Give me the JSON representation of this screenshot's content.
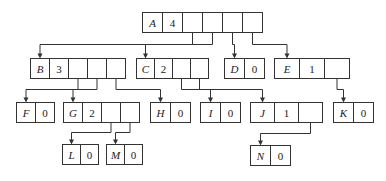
{
  "diagram": {
    "type": "tree-child-list-representation",
    "colors": {
      "stroke": "#333333",
      "text": "#222222",
      "background": "#ffffff"
    },
    "nodes": [
      {
        "id": "A",
        "label": "A",
        "degree": "4",
        "x": 142,
        "y": 12,
        "cellw": 20,
        "cells": 6
      },
      {
        "id": "B",
        "label": "B",
        "degree": "3",
        "x": 30,
        "y": 58,
        "cellw": 19,
        "cells": 5
      },
      {
        "id": "C",
        "label": "C",
        "degree": "2",
        "x": 136,
        "y": 58,
        "cellw": 18,
        "cells": 4
      },
      {
        "id": "D",
        "label": "D",
        "degree": "0",
        "x": 224,
        "y": 58,
        "cellw": 20,
        "cells": 2
      },
      {
        "id": "E",
        "label": "E",
        "degree": "1",
        "x": 274,
        "y": 58,
        "cellw": 25,
        "cells": 3
      },
      {
        "id": "F",
        "label": "F",
        "degree": "0",
        "x": 16,
        "y": 102,
        "cellw": 19,
        "cells": 2
      },
      {
        "id": "G",
        "label": "G",
        "degree": "2",
        "x": 63,
        "y": 102,
        "cellw": 19,
        "cells": 4
      },
      {
        "id": "H",
        "label": "H",
        "degree": "0",
        "x": 150,
        "y": 102,
        "cellw": 20,
        "cells": 2
      },
      {
        "id": "I",
        "label": "I",
        "degree": "0",
        "x": 200,
        "y": 102,
        "cellw": 20,
        "cells": 2
      },
      {
        "id": "J",
        "label": "J",
        "degree": "1",
        "x": 250,
        "y": 102,
        "cellw": 24,
        "cells": 3
      },
      {
        "id": "K",
        "label": "K",
        "degree": "0",
        "x": 333,
        "y": 102,
        "cellw": 20,
        "cells": 2
      },
      {
        "id": "L",
        "label": "L",
        "degree": "0",
        "x": 62,
        "y": 144,
        "cellw": 18,
        "cells": 2
      },
      {
        "id": "M",
        "label": "M",
        "degree": "0",
        "x": 106,
        "y": 144,
        "cellw": 18,
        "cells": 2
      },
      {
        "id": "N",
        "label": "N",
        "degree": "0",
        "x": 250,
        "y": 145,
        "cellw": 20,
        "cells": 2
      }
    ],
    "edges": [
      {
        "from": "A",
        "to": "B"
      },
      {
        "from": "A",
        "to": "C"
      },
      {
        "from": "A",
        "to": "D"
      },
      {
        "from": "A",
        "to": "E"
      },
      {
        "from": "B",
        "to": "F"
      },
      {
        "from": "B",
        "to": "G"
      },
      {
        "from": "B",
        "to": "H"
      },
      {
        "from": "C",
        "to": "I"
      },
      {
        "from": "C",
        "to": "J"
      },
      {
        "from": "E",
        "to": "K"
      },
      {
        "from": "G",
        "to": "L"
      },
      {
        "from": "G",
        "to": "M"
      },
      {
        "from": "J",
        "to": "N"
      }
    ]
  }
}
